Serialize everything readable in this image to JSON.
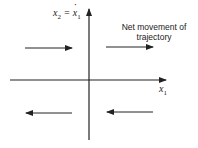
{
  "diagram": {
    "type": "phase-plane",
    "y_axis_label": {
      "var": "x",
      "sub": "2",
      "eq": " = ",
      "rhs_var": "x",
      "rhs_sub": "1",
      "rhs_accent": "dot"
    },
    "x_axis_label": {
      "var": "x",
      "sub": "1"
    },
    "annotation": {
      "line1": "Net movement of",
      "line2": "trajectory"
    },
    "arrows": [
      {
        "quadrant": "upper-left",
        "direction": "right"
      },
      {
        "quadrant": "upper-right",
        "direction": "right"
      },
      {
        "quadrant": "lower-left",
        "direction": "left"
      },
      {
        "quadrant": "lower-right",
        "direction": "left"
      }
    ],
    "colors": {
      "stroke": "#222222",
      "background": "#ffffff"
    }
  }
}
